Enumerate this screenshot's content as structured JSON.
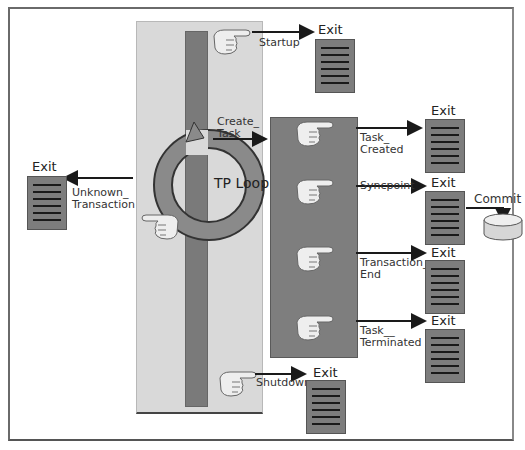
{
  "diagram": {
    "type": "flow",
    "title": "",
    "loop_label": "TP Loop",
    "exit_label": "Exit",
    "commit_label": "Commit",
    "main_hooks": [
      {
        "id": "startup",
        "label": "Startup"
      },
      {
        "id": "unknown",
        "label": "Unknown_\nTransaction"
      },
      {
        "id": "create",
        "label": "Create_\nTask"
      },
      {
        "id": "shutdown",
        "label": "Shutdown"
      }
    ],
    "task_hooks": [
      {
        "id": "task-created",
        "label": "Task_\nCreated"
      },
      {
        "id": "syncpoint",
        "label": "Syncpoint"
      },
      {
        "id": "transaction-end",
        "label": "Transaction_\nEnd"
      },
      {
        "id": "task-terminated",
        "label": "Task__\nTerminated"
      }
    ],
    "colors": {
      "panel": "#d9d9d9",
      "bar": "#7a7a7a",
      "taskbox": "#7e7e7e",
      "doc": "#7d7d7d",
      "arrow": "#1a1a1a"
    }
  }
}
